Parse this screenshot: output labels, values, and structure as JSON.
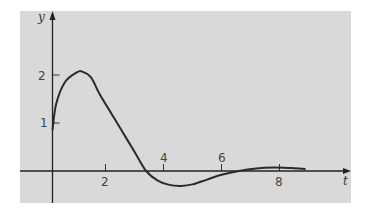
{
  "chart_data": {
    "type": "line",
    "title": "",
    "xlabel": "t",
    "ylabel": "y",
    "xlim": [
      -1,
      10.5
    ],
    "ylim": [
      -0.6,
      3.3
    ],
    "grid": false,
    "legend": null,
    "x_ticks": [
      2,
      4,
      6,
      8
    ],
    "x_tick_labels": [
      "2",
      "4",
      "6",
      "8"
    ],
    "y_ticks": [
      1,
      2
    ],
    "y_tick_labels": [
      "1",
      "2"
    ],
    "series": [
      {
        "name": "y(t)",
        "x": [
          0,
          0.3,
          0.6,
          1.0,
          1.2,
          1.5,
          1.8,
          2.2,
          2.5,
          3.0,
          3.4,
          3.8,
          4.2,
          4.6,
          5.0,
          5.5,
          6.0,
          6.6,
          7.2,
          7.8,
          8.4,
          8.9
        ],
        "y": [
          0.85,
          1.4,
          1.85,
          2.05,
          2.07,
          1.95,
          1.6,
          1.2,
          0.9,
          0.4,
          0.0,
          -0.2,
          -0.29,
          -0.31,
          -0.28,
          -0.18,
          -0.08,
          0.0,
          0.05,
          0.07,
          0.06,
          0.04
        ]
      }
    ],
    "colors": {
      "background": "#d9d9d9",
      "axis": "#222222",
      "curve": "#2a2a2a"
    }
  },
  "labels": {
    "y_axis": "y",
    "x_axis": "t",
    "xt": [
      "2",
      "4",
      "6",
      "8"
    ],
    "yt": [
      "1",
      "2"
    ]
  }
}
